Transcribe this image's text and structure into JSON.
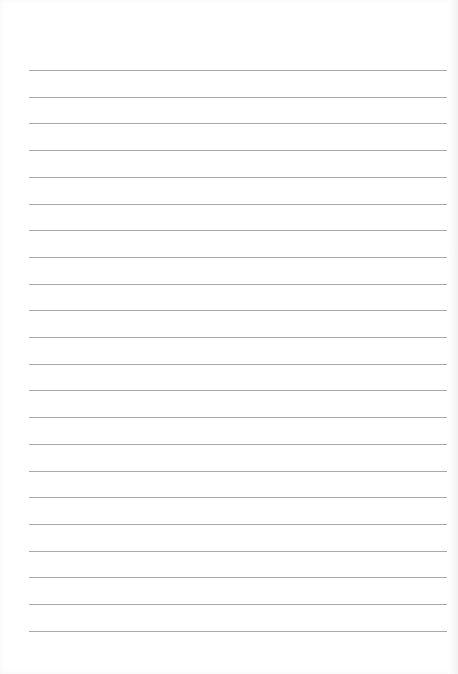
{
  "page": {
    "type": "lined-paper",
    "line_count": 22,
    "first_line_y": 70,
    "line_spacing": 26.7,
    "line_left": 29,
    "line_width": 418,
    "line_color": "#a9a9a9",
    "background_color": "#ffffff"
  }
}
